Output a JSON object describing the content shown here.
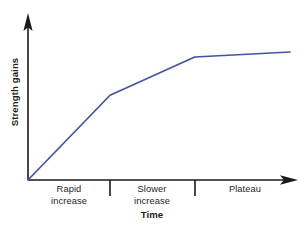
{
  "chart_data": {
    "type": "line",
    "title": "",
    "xlabel": "Time",
    "ylabel": "Strength gains",
    "xlim": [
      0,
      100
    ],
    "ylim": [
      0,
      100
    ],
    "grid": false,
    "legend": "none",
    "line_color": "#4453a4",
    "axis_color": "#1a1a1a",
    "text_color": "#231f20",
    "series": [
      {
        "name": "Strength gains over time",
        "points": [
          {
            "x": 0,
            "y": 0
          },
          {
            "x": 31,
            "y": 51
          },
          {
            "x": 63,
            "y": 74
          },
          {
            "x": 99,
            "y": 77
          }
        ]
      }
    ],
    "phases": [
      {
        "id": "phase-rapid",
        "label": "Rapid\nincrease",
        "x_start": 0,
        "x_end": 31
      },
      {
        "id": "phase-slower",
        "label": "Slower\nincrease",
        "x_start": 31,
        "x_end": 63
      },
      {
        "id": "phase-plateau",
        "label": "Plateau",
        "x_start": 63,
        "x_end": 100
      }
    ],
    "tick_positions": [
      31,
      63
    ],
    "annotations": []
  },
  "geometry": {
    "origin_x": 28,
    "origin_y": 180,
    "y_axis_top": 14,
    "x_axis_right": 297,
    "tick_bottom": 196,
    "series_path": "M28,180 L110,95 L195,57 L290,52",
    "y_arrow_path": "M28,14 L23.6,30.5 L28,27.4 L32.4,30.5 Z",
    "x_arrow_path": "M297,180 L280.5,175.3 L283.8,180 L280.5,184.7 Z",
    "ticks_x": [
      110,
      195
    ],
    "labels": [
      {
        "id": "phase-rapid",
        "center_x": 69,
        "top": 184
      },
      {
        "id": "phase-slower",
        "center_x": 152,
        "top": 184
      },
      {
        "id": "phase-plateau",
        "center_x": 245,
        "top": 184
      }
    ],
    "xlabel_center_x": 152,
    "xlabel_top": 209,
    "ylabel_center_x": 14,
    "ylabel_center_y": 92
  }
}
